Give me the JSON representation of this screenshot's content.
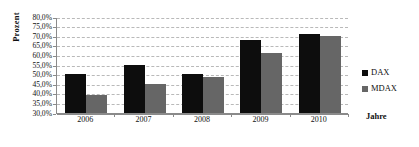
{
  "chart_data": {
    "type": "bar",
    "title": "",
    "xlabel": "Jahre",
    "ylabel": "Prozent",
    "categories": [
      "2006",
      "2007",
      "2008",
      "2009",
      "2010"
    ],
    "series": [
      {
        "name": "DAX",
        "color": "#0d0d0d",
        "values": [
          50.0,
          54.7,
          50.0,
          68.0,
          71.0
        ]
      },
      {
        "name": "MDAX",
        "color": "#666666",
        "values": [
          39.0,
          45.0,
          48.5,
          61.0,
          70.0
        ]
      }
    ],
    "ylim": [
      30.0,
      80.0
    ],
    "ytick_step": 5.0,
    "ytick_labels": [
      "80,0%",
      "75,0%",
      "70,0%",
      "65,0%",
      "60,0%",
      "55,0%",
      "50,0%",
      "45,0%",
      "40,0%",
      "35,0%",
      "30,0%"
    ],
    "ytick_values": [
      80.0,
      75.0,
      70.0,
      65.0,
      60.0,
      55.0,
      50.0,
      45.0,
      40.0,
      35.0,
      30.0
    ],
    "grid": true,
    "grid_style": "dashed",
    "legend_position": "right"
  }
}
